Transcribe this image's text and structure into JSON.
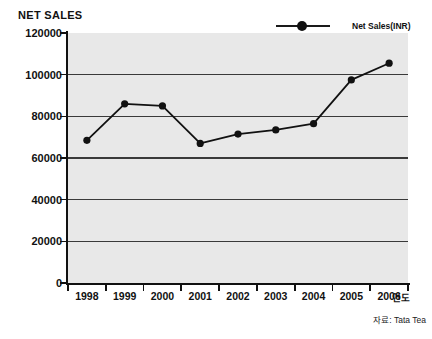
{
  "chart_data": {
    "type": "line",
    "title": "NET SALES",
    "xlabel": "연도",
    "ylabel": "",
    "categories": [
      "1998",
      "1999",
      "2000",
      "2001",
      "2002",
      "2003",
      "2004",
      "2005",
      "2006"
    ],
    "series": [
      {
        "name": "Net Sales(INR)",
        "values": [
          68500,
          86000,
          85000,
          67000,
          71500,
          73500,
          76500,
          97500,
          105500
        ]
      }
    ],
    "ylim": [
      0,
      120000
    ],
    "ytick_labels": [
      "0",
      "20000",
      "40000",
      "60000",
      "80000",
      "100000",
      "120000"
    ],
    "ytick_values": [
      0,
      20000,
      40000,
      60000,
      80000,
      100000,
      120000
    ],
    "grid": "horizontal",
    "legend_position": "top-right",
    "source_note": "자료: Tata Tea",
    "colors": {
      "line": "#111111",
      "marker": "#111111",
      "plot_background": "#e8e8e8",
      "gridline": "#3a3a3a",
      "axis": "#111111",
      "page_background": "#ffffff"
    }
  },
  "legend": {
    "label": "Net Sales(INR)"
  }
}
